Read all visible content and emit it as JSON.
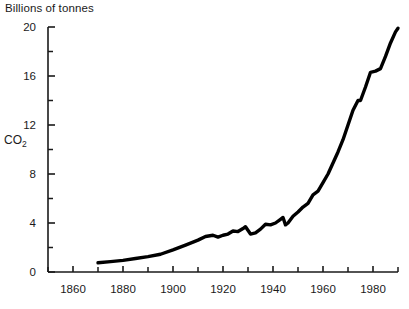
{
  "chart_data": {
    "type": "line",
    "title": "Billions of tonnes",
    "xlabel": "",
    "ylabel": "CO2",
    "ylabel_display": "CO",
    "ylabel_subscript": "2",
    "xlim": [
      1850,
      1990
    ],
    "ylim": [
      0,
      20
    ],
    "grid": false,
    "legend": null,
    "line_color": "#000000",
    "axis_color": "#1a1a1a",
    "y_ticks_major": [
      0,
      4,
      8,
      12,
      16,
      20
    ],
    "y_ticks_major_labels": [
      "0",
      "4",
      "8",
      "12",
      "16",
      "20"
    ],
    "y_ticks_minor": [
      2,
      6,
      10,
      14,
      18
    ],
    "x_ticks_major": [
      1860,
      1880,
      1900,
      1920,
      1940,
      1960,
      1980
    ],
    "x_ticks_major_labels": [
      "1860",
      "1880",
      "1900",
      "1920",
      "1940",
      "1960",
      "1980"
    ],
    "x_ticks_minor": [
      1850,
      1870,
      1890,
      1910,
      1930,
      1950,
      1970,
      1990
    ],
    "series": [
      {
        "name": "Global CO2 emissions",
        "x": [
          1870,
          1875,
          1880,
          1885,
          1890,
          1895,
          1900,
          1905,
          1910,
          1913,
          1916,
          1918,
          1920,
          1922,
          1924,
          1926,
          1928,
          1929,
          1931,
          1933,
          1935,
          1937,
          1939,
          1941,
          1943,
          1944,
          1945,
          1946,
          1948,
          1950,
          1952,
          1954,
          1956,
          1958,
          1960,
          1962,
          1964,
          1966,
          1968,
          1970,
          1972,
          1974,
          1975,
          1977,
          1979,
          1981,
          1983,
          1985,
          1987,
          1989,
          1990
        ],
        "y": [
          0.75,
          0.85,
          0.95,
          1.1,
          1.25,
          1.45,
          1.8,
          2.2,
          2.6,
          2.9,
          3.0,
          2.85,
          3.0,
          3.1,
          3.35,
          3.3,
          3.55,
          3.7,
          3.1,
          3.2,
          3.5,
          3.9,
          3.85,
          4.0,
          4.3,
          4.45,
          3.85,
          4.0,
          4.55,
          4.9,
          5.3,
          5.6,
          6.3,
          6.6,
          7.3,
          8.0,
          8.9,
          9.8,
          10.8,
          12.0,
          13.2,
          14.0,
          14.0,
          15.1,
          16.3,
          16.4,
          16.6,
          17.6,
          18.7,
          19.6,
          19.9
        ]
      }
    ]
  },
  "axes": {
    "origin_label": "0",
    "top_label": "20"
  }
}
